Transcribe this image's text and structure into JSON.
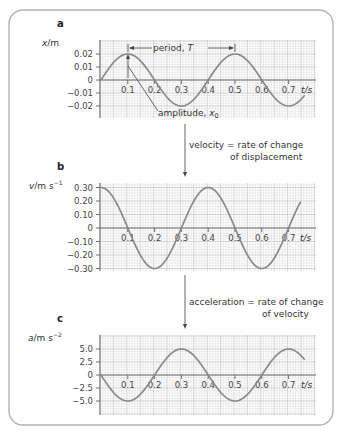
{
  "figure": {
    "frame_color": "#b3b3b3",
    "curve_color": "#8a8a8a",
    "grid_color": "#dcdcdc"
  },
  "panels": [
    {
      "id": "a",
      "label": "a",
      "ylabel_var": "x",
      "ylabel_unit": "/m",
      "xlabel": "t/s",
      "y_ticks": [
        "0.02",
        "0.01",
        "0",
        "−0.01",
        "−0.02"
      ],
      "x_ticks": [
        "0.1",
        "0.2",
        "0.3",
        "0.4",
        "0.5",
        "0.6",
        "0.7"
      ],
      "annotations": {
        "period": "period, ",
        "period_symbol": "T",
        "amplitude": "amplitude, ",
        "amplitude_symbol": "x",
        "amplitude_sub": "0"
      }
    },
    {
      "id": "b",
      "label": "b",
      "ylabel_var": "v",
      "ylabel_unit": "/m s",
      "ylabel_exp": "−1",
      "xlabel": "t/s",
      "y_ticks": [
        "0.30",
        "0.20",
        "0.10",
        "0",
        "−0.10",
        "−0.20",
        "−0.30"
      ],
      "x_ticks": [
        "0.1",
        "0.2",
        "0.3",
        "0.4",
        "0.5",
        "0.6",
        "0.7"
      ]
    },
    {
      "id": "c",
      "label": "c",
      "ylabel_var": "a",
      "ylabel_unit": "/m s",
      "ylabel_exp": "−2",
      "xlabel": "t/s",
      "y_ticks": [
        "5.0",
        "2.5",
        "0",
        "−2.5",
        "−5.0"
      ],
      "x_ticks": [
        "0.1",
        "0.2",
        "0.3",
        "0.4",
        "0.5",
        "0.6",
        "0.7"
      ]
    }
  ],
  "connectors": [
    {
      "line1": "velocity = rate of change",
      "line2": "of displacement"
    },
    {
      "line1": "acceleration = rate of change",
      "line2": "of velocity"
    }
  ],
  "chart_data": [
    {
      "type": "line",
      "title": "a",
      "xlabel": "t/s",
      "ylabel": "x/m",
      "xlim": [
        0,
        0.76
      ],
      "ylim": [
        -0.02,
        0.02
      ],
      "grid": true,
      "x": [
        0,
        0.1,
        0.2,
        0.3,
        0.4,
        0.5,
        0.6,
        0.7
      ],
      "series": [
        {
          "name": "displacement",
          "values": [
            0,
            0.02,
            0,
            -0.02,
            0,
            0.02,
            0,
            -0.02
          ]
        }
      ],
      "function": "x = 0.02 sin(2πt/0.4)",
      "annotations": [
        "period, T (0.1 s to 0.5 s)",
        "amplitude, x0 = 0.02 m"
      ]
    },
    {
      "type": "line",
      "title": "b",
      "xlabel": "t/s",
      "ylabel": "v/m s⁻¹",
      "xlim": [
        0,
        0.745
      ],
      "ylim": [
        -0.3,
        0.3
      ],
      "grid": true,
      "x": [
        0,
        0.1,
        0.2,
        0.3,
        0.4,
        0.5,
        0.6,
        0.7
      ],
      "series": [
        {
          "name": "velocity",
          "values": [
            0.3,
            0,
            -0.3,
            0,
            0.3,
            0,
            -0.3,
            0
          ]
        }
      ],
      "function": "v = 0.30 cos(2πt/0.4)"
    },
    {
      "type": "line",
      "title": "c",
      "xlabel": "t/s",
      "ylabel": "a/m s⁻²",
      "xlim": [
        0,
        0.76
      ],
      "ylim": [
        -5.0,
        5.0
      ],
      "grid": true,
      "x": [
        0,
        0.1,
        0.2,
        0.3,
        0.4,
        0.5,
        0.6,
        0.7
      ],
      "series": [
        {
          "name": "acceleration",
          "values": [
            0,
            -5.0,
            0,
            5.0,
            0,
            -5.0,
            0,
            5.0
          ]
        }
      ],
      "function": "a = −5.0 sin(2πt/0.4)"
    }
  ]
}
